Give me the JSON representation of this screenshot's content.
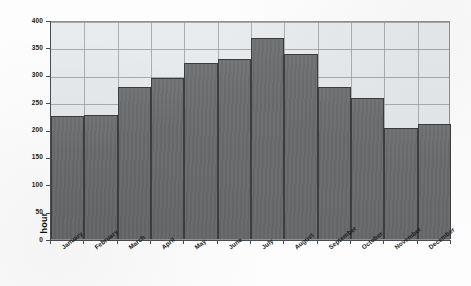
{
  "chart_data": {
    "type": "bar",
    "title": "",
    "xlabel": "",
    "ylabel": "hour",
    "categories": [
      "January",
      "February",
      "March",
      "April",
      "May",
      "June",
      "July",
      "August",
      "September",
      "October",
      "November",
      "December"
    ],
    "values": [
      225,
      227,
      277,
      295,
      321,
      328,
      368,
      338,
      277,
      257,
      202,
      210
    ],
    "ylim": [
      0,
      400
    ],
    "yticks": [
      0,
      50,
      100,
      150,
      200,
      250,
      300,
      350,
      400
    ],
    "ytick_labels": [
      "0",
      "50",
      "100",
      "150",
      "200",
      "250",
      "300",
      "350",
      "400"
    ],
    "grid": true,
    "legend": false,
    "series": [
      {
        "name": "hour",
        "values": [
          225,
          227,
          277,
          295,
          321,
          328,
          368,
          338,
          277,
          257,
          202,
          210
        ]
      }
    ],
    "colors": {
      "bar_fill": "#696b6d",
      "bar_edge": "#3c3e40",
      "plot_background": "#e6e9ec",
      "gridline": "#9aa0a4",
      "axis": "#4a4d50",
      "text": "#1a1a1a",
      "page_background": "#fdfdfd"
    }
  }
}
